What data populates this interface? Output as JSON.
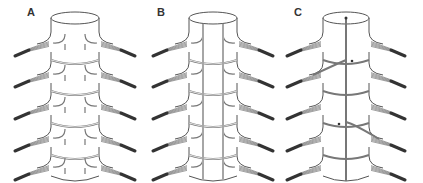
{
  "figure": {
    "panels": [
      {
        "id": "A",
        "label": "A",
        "variant": "segmental-rings"
      },
      {
        "id": "B",
        "label": "B",
        "variant": "rings-with-longitudinal-anastomoses"
      },
      {
        "id": "C",
        "label": "C",
        "variant": "single-midline-with-two-feeders"
      }
    ],
    "levels": 5,
    "colors": {
      "outline": "#555555",
      "vessel": "#777777",
      "root": "#333333",
      "background": "#ffffff"
    }
  }
}
